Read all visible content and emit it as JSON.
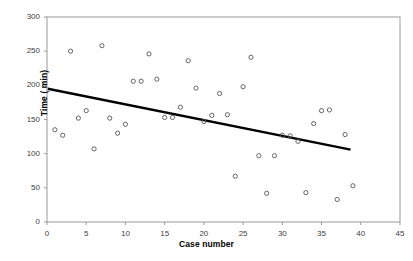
{
  "chart_data": {
    "type": "scatter",
    "title": "",
    "xlabel": "Case number",
    "ylabel": "Time ( min)",
    "xlim": [
      0,
      45
    ],
    "ylim": [
      0,
      300
    ],
    "xticks": [
      0,
      5,
      10,
      15,
      20,
      25,
      30,
      35,
      40,
      45
    ],
    "yticks": [
      0,
      50,
      100,
      150,
      200,
      250,
      300
    ],
    "grid": false,
    "legend": false,
    "marker": "open-circle",
    "marker_color": "#555555",
    "series": [
      {
        "name": "Time per case",
        "x": [
          1,
          2,
          3,
          4,
          5,
          6,
          7,
          8,
          9,
          10,
          11,
          12,
          13,
          14,
          15,
          16,
          17,
          18,
          19,
          20,
          21,
          22,
          23,
          24,
          25,
          26,
          27,
          28,
          29,
          30,
          31,
          32,
          33,
          34,
          35,
          36,
          37,
          38,
          39
        ],
        "y": [
          135,
          127,
          250,
          152,
          163,
          107,
          258,
          152,
          130,
          143,
          206,
          206,
          246,
          209,
          153,
          153,
          168,
          236,
          196,
          147,
          156,
          188,
          157,
          67,
          198,
          241,
          97,
          42,
          97,
          127,
          126,
          118,
          43,
          144,
          163,
          164,
          33,
          128,
          53
        ]
      }
    ],
    "trendline": {
      "type": "linear",
      "x_start": 0.1,
      "y_start": 195,
      "x_end": 38.7,
      "y_end": 106,
      "color": "#000000",
      "width": 2.4
    }
  },
  "axes": {
    "y_tick_labels": [
      "300",
      "250",
      "200",
      "150",
      "100",
      "50",
      "0"
    ],
    "x_tick_labels": [
      "0",
      "5",
      "10",
      "15",
      "20",
      "25",
      "30",
      "35",
      "40",
      "45"
    ],
    "x_title": "Case number",
    "y_title": "Time ( min)",
    "frame_color": "#9a9a9a"
  }
}
